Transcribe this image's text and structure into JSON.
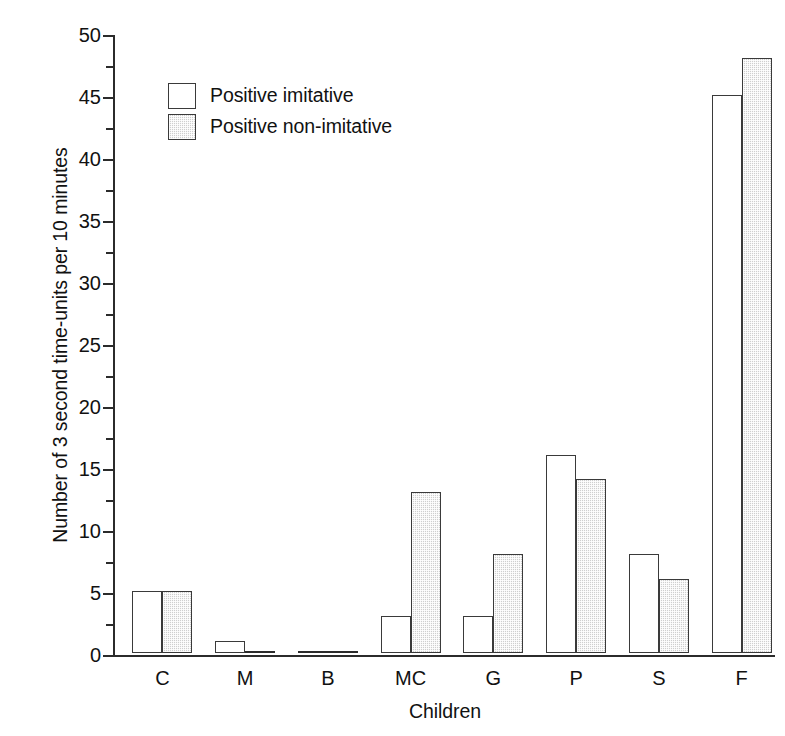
{
  "chart_data": {
    "type": "bar",
    "title": "",
    "xlabel": "Children",
    "ylabel": "Number of 3 second time-units per 10 minutes",
    "categories": [
      "C",
      "M",
      "B",
      "MC",
      "G",
      "P",
      "S",
      "F"
    ],
    "series": [
      {
        "name": "Positive imitative",
        "values": [
          5,
          1,
          0,
          3,
          3,
          16,
          8,
          45
        ],
        "swatch": "open",
        "color": "#ffffff"
      },
      {
        "name": "Positive non-imitative",
        "values": [
          5,
          0,
          0,
          13,
          8,
          14,
          6,
          48
        ],
        "swatch": "filled",
        "color": "#cfcfcf"
      }
    ],
    "ylim": [
      0,
      50
    ],
    "ytick_major": [
      0,
      5,
      10,
      15,
      20,
      25,
      30,
      35,
      40,
      45,
      50
    ],
    "ytick_major_labels": [
      "0",
      "5",
      "10",
      "15",
      "20",
      "25",
      "30",
      "35",
      "40",
      "45",
      "50"
    ],
    "ytick_minor": [
      2.5,
      7.5,
      12.5,
      17.5,
      22.5,
      27.5,
      32.5,
      37.5,
      42.5,
      47.5
    ],
    "grid": false,
    "legend_position": "upper-left-inside",
    "axis_color": "#2b2b2b",
    "bar_edge_color": "#3a3a3a"
  },
  "legend": {
    "items": [
      {
        "label": "Positive imitative",
        "swatch": "open"
      },
      {
        "label": "Positive non-imitative",
        "swatch": "filled"
      }
    ]
  }
}
